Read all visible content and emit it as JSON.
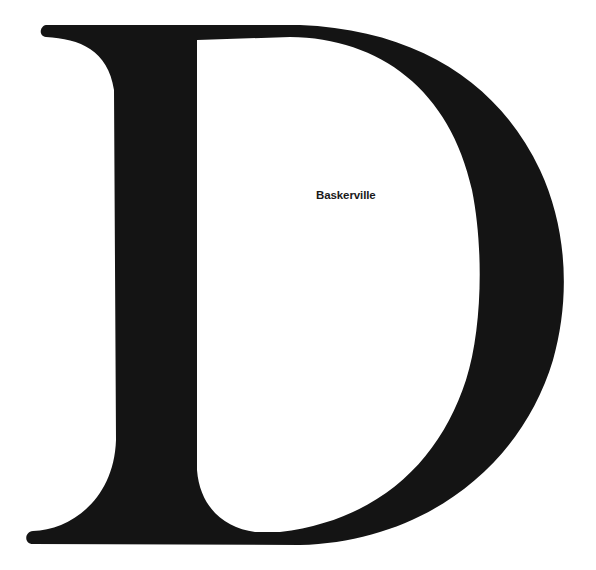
{
  "specimen": {
    "letter": "D",
    "typeface_label": "Baskerville",
    "glyph_color": "#141414",
    "background_color": "#ffffff"
  }
}
